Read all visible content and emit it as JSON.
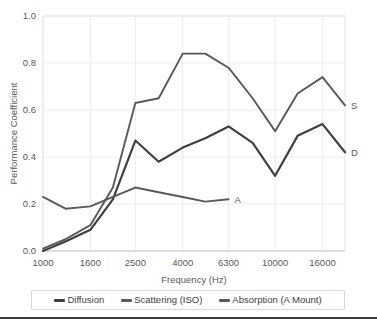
{
  "chart_data": {
    "type": "line",
    "title": "",
    "xlabel": "Frequency (Hz)",
    "ylabel": "Performance Coefficient",
    "ylim": [
      0.0,
      1.0
    ],
    "ytick_labels": [
      "0.0",
      "0.2",
      "0.4",
      "0.6",
      "0.8",
      "1.0"
    ],
    "ytick_values": [
      0.0,
      0.2,
      0.4,
      0.6,
      0.8,
      1.0
    ],
    "xtick_labels": [
      "1000",
      "1600",
      "2500",
      "4000",
      "6300",
      "10000",
      "16000"
    ],
    "xtick_values": [
      1000,
      1600,
      2500,
      4000,
      6300,
      10000,
      16000
    ],
    "x": [
      1000,
      1250,
      1600,
      2000,
      2500,
      3150,
      4000,
      5000,
      6300,
      8000,
      10000,
      12500,
      16000,
      20000
    ],
    "grid": true,
    "legend_position": "bottom",
    "series": [
      {
        "name": "Diffusion",
        "end_label": "D",
        "color": "#404040",
        "values": [
          0.0,
          0.04,
          0.09,
          0.22,
          0.47,
          0.38,
          0.44,
          0.48,
          0.53,
          0.46,
          0.32,
          0.49,
          0.54,
          0.42
        ]
      },
      {
        "name": "Scattering (ISO)",
        "end_label": "S",
        "color": "#595959",
        "values": [
          0.01,
          0.05,
          0.11,
          0.27,
          0.63,
          0.65,
          0.84,
          0.84,
          0.78,
          0.65,
          0.51,
          0.67,
          0.74,
          0.62
        ]
      },
      {
        "name": "Absorption (A Mount)",
        "end_label": "A",
        "color": "#595959",
        "values": [
          0.23,
          0.18,
          0.19,
          0.23,
          0.27,
          0.25,
          0.23,
          0.21,
          0.22,
          null,
          null,
          null,
          null,
          null
        ]
      }
    ]
  },
  "legend": {
    "items": [
      {
        "label": "Diffusion",
        "color": "#404040"
      },
      {
        "label": "Scattering (ISO)",
        "color": "#595959"
      },
      {
        "label": "Absorption (A Mount)",
        "color": "#595959"
      }
    ]
  }
}
